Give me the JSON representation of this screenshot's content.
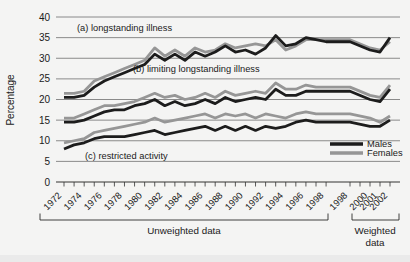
{
  "chart_data": {
    "type": "line",
    "ylabel": "Percentage",
    "ylim": [
      0,
      40
    ],
    "yticks": [
      0,
      5,
      10,
      15,
      20,
      25,
      30,
      35,
      40
    ],
    "grid": "horizontal",
    "legend_position": "lower-right-inside",
    "annotations": [
      "(a) longstanding illness",
      "(b) limiting longstanding illness",
      "(c) restricted activity"
    ],
    "x_unweighted_years": [
      1972,
      1973,
      1974,
      1975,
      1976,
      1977,
      1978,
      1979,
      1980,
      1981,
      1982,
      1983,
      1984,
      1985,
      1986,
      1987,
      1988,
      1989,
      1990,
      1991,
      1992,
      1993,
      1994,
      1995,
      1996,
      1997,
      1998
    ],
    "x_unweighted_tick_labels": [
      "1972",
      "1974",
      "1976",
      "1978",
      "1980",
      "1982",
      "1984",
      "1986",
      "1988",
      "1990",
      "1992",
      "1994",
      "1996",
      "1998"
    ],
    "x_weighted_years": [
      1998,
      1999,
      2000,
      2001,
      2002
    ],
    "x_weighted_tick_labels": [
      "1998",
      "2000",
      "2001",
      "2002"
    ],
    "axis_sections": [
      {
        "label": "Unweighted data",
        "lines": [
          "Unweighted data"
        ]
      },
      {
        "label": "Weighted data",
        "lines": [
          "Weighted",
          "data"
        ]
      }
    ],
    "legend": [
      {
        "label": "Males",
        "color": "#1c1c1c"
      },
      {
        "label": "Females",
        "color": "#969696"
      }
    ],
    "series": [
      {
        "name": "Longstanding illness - Females",
        "group": "a",
        "sex": "Females",
        "color": "#969696",
        "values_unweighted": [
          21.5,
          21.5,
          22,
          24.5,
          25.5,
          26.5,
          27.5,
          28.5,
          29.5,
          32.5,
          30.5,
          32,
          30.5,
          32.5,
          31.5,
          32,
          33.5,
          32.5,
          33,
          33.5,
          33,
          34.5,
          32,
          33,
          34.5,
          34.5,
          34.5
        ],
        "values_weighted": [
          34.5,
          32.5,
          32,
          34
        ]
      },
      {
        "name": "Longstanding illness - Males",
        "group": "a",
        "sex": "Males",
        "color": "#1c1c1c",
        "values_unweighted": [
          20.5,
          20.5,
          21,
          23,
          24.5,
          25.5,
          26.5,
          27.5,
          28.5,
          31,
          29.5,
          31,
          29.5,
          31.5,
          30.5,
          31.5,
          33,
          31.5,
          32,
          31,
          32.5,
          35.5,
          33,
          33.5,
          35,
          34.5,
          34
        ],
        "values_weighted": [
          34,
          32,
          31.5,
          35
        ]
      },
      {
        "name": "Limiting longstanding illness - Females",
        "group": "b",
        "sex": "Females",
        "color": "#969696",
        "values_unweighted": [
          15.5,
          15.5,
          16.5,
          17.5,
          18.5,
          18.5,
          19,
          19.5,
          20.5,
          21.5,
          20.5,
          21,
          20,
          20.5,
          21.5,
          20.5,
          22,
          21,
          21.5,
          22,
          21.5,
          24,
          22.5,
          22.5,
          23.5,
          23,
          23
        ],
        "values_weighted": [
          23,
          21,
          20.5,
          23.5
        ]
      },
      {
        "name": "Limiting longstanding illness - Males",
        "group": "b",
        "sex": "Males",
        "color": "#1c1c1c",
        "values_unweighted": [
          14.5,
          14.5,
          15,
          16,
          17,
          17.5,
          17.5,
          18.5,
          19,
          20,
          18.5,
          19.5,
          18.5,
          19,
          20,
          19,
          20.5,
          19.5,
          20,
          20.5,
          20,
          22.5,
          21,
          21,
          22,
          22,
          22
        ],
        "values_weighted": [
          22,
          20,
          19.5,
          22.5
        ]
      },
      {
        "name": "Restricted activity - Females",
        "group": "c",
        "sex": "Females",
        "color": "#969696",
        "values_unweighted": [
          9.5,
          10,
          10.5,
          12,
          12.5,
          13,
          13.5,
          14,
          14.5,
          15.5,
          14.5,
          15,
          15.5,
          16,
          16.5,
          15.5,
          16.5,
          16,
          16.5,
          15.5,
          16.5,
          16,
          15.5,
          16.5,
          17,
          16.5,
          16.5
        ],
        "values_weighted": [
          16.5,
          15.5,
          14.5,
          16
        ]
      },
      {
        "name": "Restricted activity - Males",
        "group": "c",
        "sex": "Males",
        "color": "#1c1c1c",
        "values_unweighted": [
          8,
          9,
          9.5,
          10.5,
          11,
          11,
          11,
          11.5,
          12,
          12.5,
          11.5,
          12,
          12.5,
          13,
          13.5,
          12.5,
          13.5,
          12.5,
          13.5,
          12.5,
          13.5,
          13,
          13.5,
          14.5,
          15,
          14.5,
          14.5
        ],
        "values_weighted": [
          14.5,
          13.5,
          13.5,
          15
        ]
      }
    ]
  }
}
